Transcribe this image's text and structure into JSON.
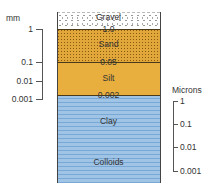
{
  "left_axis": {
    "unit": "mm",
    "ticks": [
      "1",
      "0.1",
      "0.01",
      "0.001"
    ]
  },
  "right_axis": {
    "unit": "Microns",
    "ticks": [
      "1",
      "0.1",
      "0.01",
      "0.001"
    ]
  },
  "layers": [
    {
      "name": "Gravel",
      "color": "#ffffff"
    },
    {
      "name": "Sand",
      "color": "#e2a73a"
    },
    {
      "name": "Silt",
      "color": "#e8ae3e"
    },
    {
      "name": "Clay",
      "color": "#9fc4e6"
    },
    {
      "name": "Colloids",
      "color": "#9fc4e6"
    }
  ],
  "boundaries": [
    "1.0",
    "0.05",
    "0.002"
  ]
}
